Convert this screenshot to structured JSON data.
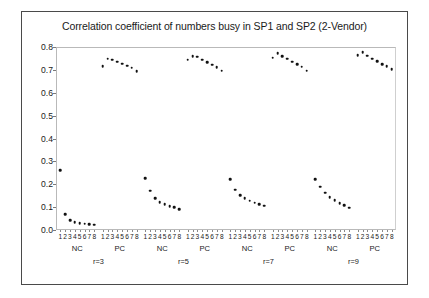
{
  "chart_data": {
    "type": "scatter",
    "title": "Correlation coefficient of numbers busy in SP1 and SP2 (2-Vendor)",
    "xlabel": "",
    "ylabel": "",
    "ylim": [
      0.0,
      0.8
    ],
    "yticks": [
      0.0,
      0.1,
      0.2,
      0.3,
      0.4,
      0.5,
      0.6,
      0.7,
      0.8
    ],
    "ytick_labels": [
      "0.0",
      "0.1",
      "0.2",
      "0.3",
      "0.4",
      "0.5",
      "0.6",
      "0.7",
      "0.8"
    ],
    "grid": false,
    "legend": "none",
    "marker_color": "#111111",
    "x_categories": [
      "1",
      "2",
      "3",
      "4",
      "5",
      "6",
      "7",
      "8"
    ],
    "panel_labels": [
      "NC",
      "PC"
    ],
    "group_labels": [
      "r=3",
      "r=5",
      "r=7",
      "r=9"
    ],
    "panels": [
      {
        "group": "r=3",
        "panel": "NC",
        "x": [
          "1",
          "2",
          "3",
          "4",
          "5",
          "6",
          "7",
          "8"
        ],
        "values": [
          0.261,
          0.069,
          0.042,
          0.033,
          0.029,
          0.027,
          0.025,
          0.024
        ]
      },
      {
        "group": "r=3",
        "panel": "PC",
        "x": [
          "1",
          "2",
          "3",
          "4",
          "5",
          "6",
          "7",
          "8"
        ],
        "values": [
          0.716,
          0.748,
          0.744,
          0.736,
          0.727,
          0.718,
          0.709,
          0.693
        ]
      },
      {
        "group": "r=5",
        "panel": "NC",
        "x": [
          "1",
          "2",
          "3",
          "4",
          "5",
          "6",
          "7",
          "8"
        ],
        "values": [
          0.226,
          0.171,
          0.139,
          0.122,
          0.112,
          0.105,
          0.099,
          0.091
        ]
      },
      {
        "group": "r=5",
        "panel": "PC",
        "x": [
          "1",
          "2",
          "3",
          "4",
          "5",
          "6",
          "7",
          "8"
        ],
        "values": [
          0.744,
          0.761,
          0.757,
          0.745,
          0.733,
          0.722,
          0.712,
          0.697
        ]
      },
      {
        "group": "r=7",
        "panel": "NC",
        "x": [
          "1",
          "2",
          "3",
          "4",
          "5",
          "6",
          "7",
          "8"
        ],
        "values": [
          0.221,
          0.177,
          0.153,
          0.138,
          0.128,
          0.119,
          0.113,
          0.106
        ]
      },
      {
        "group": "r=7",
        "panel": "PC",
        "x": [
          "1",
          "2",
          "3",
          "4",
          "5",
          "6",
          "7",
          "8"
        ],
        "values": [
          0.754,
          0.774,
          0.761,
          0.748,
          0.735,
          0.724,
          0.713,
          0.697
        ]
      },
      {
        "group": "r=9",
        "panel": "NC",
        "x": [
          "1",
          "2",
          "3",
          "4",
          "5",
          "6",
          "7",
          "8"
        ],
        "values": [
          0.222,
          0.189,
          0.163,
          0.143,
          0.129,
          0.117,
          0.108,
          0.097
        ]
      },
      {
        "group": "r=9",
        "panel": "PC",
        "x": [
          "1",
          "2",
          "3",
          "4",
          "5",
          "6",
          "7",
          "8"
        ],
        "values": [
          0.765,
          0.777,
          0.762,
          0.749,
          0.737,
          0.726,
          0.715,
          0.702
        ]
      }
    ]
  }
}
